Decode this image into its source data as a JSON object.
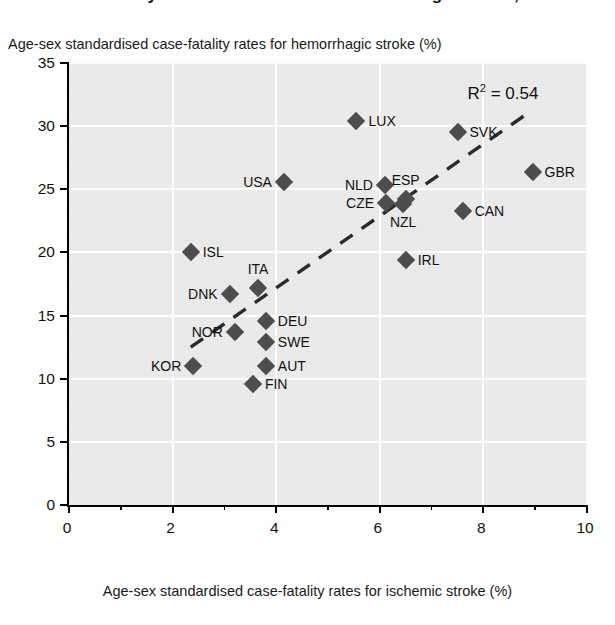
{
  "title": "Case-fatality rates for ischemic and hemorrhagic stroke, 2011",
  "axes": {
    "y_label": "Age-sex standardised case-fatality rates for hemorrhagic stroke (%)",
    "x_label": "Age-sex standardised case-fatality rates for ischemic stroke (%)",
    "y_ticks": [
      "0",
      "5",
      "10",
      "15",
      "20",
      "25",
      "30",
      "35"
    ],
    "x_ticks": [
      "0",
      "2",
      "4",
      "6",
      "8",
      "10"
    ]
  },
  "annotation": {
    "r2_prefix": "R",
    "r2_exp": "2",
    "r2_value": " = 0.54"
  },
  "colors": {
    "plot_background": "#ebebeb",
    "marker": "#4d4d4d",
    "grid": "#fcfcfc",
    "axis": "#000000",
    "text": "#111111"
  },
  "chart_data": {
    "type": "scatter",
    "title": "Case-fatality rates for ischemic and hemorrhagic stroke, 2011",
    "xlabel": "Age-sex standardised case-fatality rates for ischemic stroke (%)",
    "ylabel": "Age-sex standardised case-fatality rates for hemorrhagic stroke (%)",
    "xlim": [
      0,
      10
    ],
    "ylim": [
      0,
      35
    ],
    "xticks": [
      0,
      2,
      4,
      6,
      8,
      10
    ],
    "yticks": [
      0,
      5,
      10,
      15,
      20,
      25,
      30,
      35
    ],
    "x_minor_ticks": [
      1,
      3,
      5,
      7,
      9
    ],
    "grid": true,
    "legend": false,
    "annotations": [
      {
        "text": "R² = 0.54",
        "x": 9.1,
        "y": 32.6
      }
    ],
    "trendline": {
      "style": "dashed",
      "x": [
        2.35,
        8.85
      ],
      "y": [
        12.5,
        31.0
      ]
    },
    "points": [
      {
        "label": "LUX",
        "x": 5.55,
        "y": 30.4,
        "label_pos": "right"
      },
      {
        "label": "SVK",
        "x": 7.5,
        "y": 29.5,
        "label_pos": "right"
      },
      {
        "label": "GBR",
        "x": 8.95,
        "y": 26.4,
        "label_pos": "right"
      },
      {
        "label": "USA",
        "x": 4.15,
        "y": 25.6,
        "label_pos": "left"
      },
      {
        "label": "NLD",
        "x": 6.1,
        "y": 25.3,
        "label_pos": "left"
      },
      {
        "label": "ESP",
        "x": 6.5,
        "y": 24.2,
        "label_pos": "top"
      },
      {
        "label": "CZE",
        "x": 6.12,
        "y": 23.9,
        "label_pos": "left"
      },
      {
        "label": "NZL",
        "x": 6.45,
        "y": 23.8,
        "label_pos": "bottom"
      },
      {
        "label": "CAN",
        "x": 7.6,
        "y": 23.3,
        "label_pos": "right"
      },
      {
        "label": "ISL",
        "x": 2.35,
        "y": 20.0,
        "label_pos": "right"
      },
      {
        "label": "IRL",
        "x": 6.5,
        "y": 19.4,
        "label_pos": "right"
      },
      {
        "label": "ITA",
        "x": 3.65,
        "y": 17.2,
        "label_pos": "top"
      },
      {
        "label": "DNK",
        "x": 3.1,
        "y": 16.7,
        "label_pos": "left"
      },
      {
        "label": "DEU",
        "x": 3.8,
        "y": 14.6,
        "label_pos": "right"
      },
      {
        "label": "NOR",
        "x": 3.2,
        "y": 13.7,
        "label_pos": "left"
      },
      {
        "label": "SWE",
        "x": 3.8,
        "y": 12.9,
        "label_pos": "right"
      },
      {
        "label": "KOR",
        "x": 2.4,
        "y": 11.0,
        "label_pos": "left"
      },
      {
        "label": "AUT",
        "x": 3.8,
        "y": 11.0,
        "label_pos": "right"
      },
      {
        "label": "FIN",
        "x": 3.55,
        "y": 9.6,
        "label_pos": "right"
      }
    ]
  }
}
